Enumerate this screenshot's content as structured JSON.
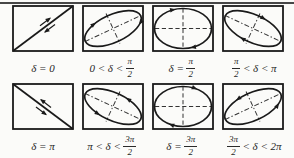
{
  "colors": {
    "ink": "#1a1a1a",
    "rule": "#474747",
    "background": "#fbfbf9",
    "label_text": "#1f1f1f"
  },
  "panels": [
    {
      "id": "delta-0",
      "figure": "diagonal-line-ascending-with-double-arrows",
      "label": {
        "text": "δ = 0"
      }
    },
    {
      "id": "delta-0-to-pi2",
      "figure": "ellipse-tilted-ascending-clockwise",
      "label": {
        "pre": "0 < δ <",
        "frac": {
          "num": "π",
          "den": "2"
        }
      }
    },
    {
      "id": "delta-pi2",
      "figure": "ellipse-axis-aligned-dashed-cross",
      "label": {
        "pre": "δ =",
        "frac": {
          "num": "π",
          "den": "2"
        }
      }
    },
    {
      "id": "pi2-to-pi",
      "figure": "ellipse-tilted-descending-clockwise",
      "label": {
        "frac": {
          "num": "π",
          "den": "2"
        },
        "post": "< δ < π"
      }
    },
    {
      "id": "delta-pi",
      "figure": "diagonal-line-descending-with-double-arrows",
      "label": {
        "text": "δ = π"
      }
    },
    {
      "id": "pi-to-3pi2",
      "figure": "ellipse-tilted-descending-counterclockwise",
      "label": {
        "pre": "π < δ <",
        "frac": {
          "num": "3π",
          "den": "2"
        }
      }
    },
    {
      "id": "delta-3pi2",
      "figure": "ellipse-axis-aligned-dashed-cross",
      "label": {
        "pre": "δ =",
        "frac": {
          "num": "3π",
          "den": "2"
        }
      }
    },
    {
      "id": "3pi2-to-2pi",
      "figure": "ellipse-tilted-ascending-counterclockwise",
      "label": {
        "frac": {
          "num": "3π",
          "den": "2"
        },
        "post": "< δ < 2π"
      }
    }
  ]
}
